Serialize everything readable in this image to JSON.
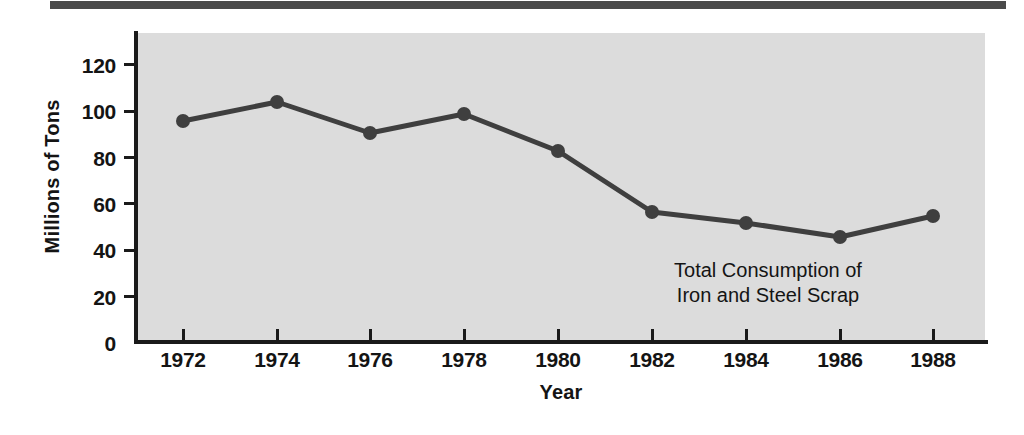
{
  "chart_data": {
    "type": "line",
    "title": "",
    "annotation_lines": [
      "Total Consumption of",
      "Iron and Steel Scrap"
    ],
    "xlabel": "Year",
    "ylabel": "Millions of Tons",
    "x": [
      1972,
      1974,
      1976,
      1978,
      1980,
      1982,
      1984,
      1986,
      1988
    ],
    "xtick_labels": [
      "1972",
      "1974",
      "1976",
      "1978",
      "1980",
      "1982",
      "1984",
      "1986",
      "1988"
    ],
    "values": [
      95,
      103,
      90,
      98,
      82,
      56,
      51,
      45,
      54
    ],
    "series": [
      {
        "name": "Total Consumption of Iron and Steel Scrap",
        "values": [
          95,
          103,
          90,
          98,
          82,
          56,
          51,
          45,
          54
        ]
      }
    ],
    "ylim": [
      0,
      130
    ],
    "ytick_labels": [
      "0",
      "20",
      "40",
      "60",
      "80",
      "100",
      "120"
    ],
    "yticks": [
      0,
      20,
      40,
      60,
      80,
      100,
      120
    ],
    "xlim": [
      1971,
      1989
    ],
    "grid": false,
    "legend": "none",
    "marker": "circle",
    "colors": {
      "line": "#3f3f3f",
      "marker": "#3f3f3f",
      "plot_background": "#dcdcdc",
      "figure_background": "#ffffff",
      "axis": "#1a1a1a",
      "top_rule": "#4a4a4a",
      "text": "#141414"
    }
  },
  "axes": {
    "y_ticks": [
      {
        "label": "120",
        "top": 54
      },
      {
        "label": "100",
        "top": 100
      },
      {
        "label": "80",
        "top": 147
      },
      {
        "label": "60",
        "top": 193
      },
      {
        "label": "40",
        "top": 239
      },
      {
        "label": "20",
        "top": 286
      },
      {
        "label": "0",
        "top": 332
      }
    ],
    "y_tick_marks": [
      63,
      110,
      156,
      202,
      249,
      295
    ],
    "x_ticks": [
      {
        "label": "1972",
        "left": 183
      },
      {
        "label": "1974",
        "left": 277
      },
      {
        "label": "1976",
        "left": 370
      },
      {
        "label": "1978",
        "left": 464
      },
      {
        "label": "1980",
        "left": 558
      },
      {
        "label": "1982",
        "left": 652
      },
      {
        "label": "1984",
        "left": 746
      },
      {
        "label": "1986",
        "left": 840
      },
      {
        "label": "1988",
        "left": 933
      }
    ]
  },
  "points": [
    {
      "cx": 183,
      "cy": 121
    },
    {
      "cx": 277,
      "cy": 102
    },
    {
      "cx": 370,
      "cy": 133
    },
    {
      "cx": 464,
      "cy": 114
    },
    {
      "cx": 558,
      "cy": 151
    },
    {
      "cx": 652,
      "cy": 212
    },
    {
      "cx": 746,
      "cy": 223
    },
    {
      "cx": 840,
      "cy": 237
    },
    {
      "cx": 933,
      "cy": 216
    }
  ],
  "polyline": "183,121 277,102 370,133 464,114 558,151 652,212 746,223 840,237 933,216"
}
